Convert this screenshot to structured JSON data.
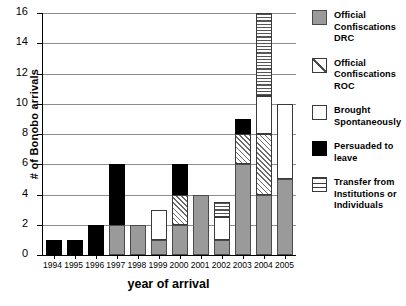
{
  "chart_data": {
    "type": "bar",
    "title": "",
    "subtitle": "",
    "xlabel": "year of arrival",
    "ylabel": "# of Bonobo arrivals",
    "ylim": [
      0,
      16
    ],
    "ytick_step": 2,
    "yticks": [
      "16",
      "14",
      "12",
      "10",
      "8",
      "6",
      "4",
      "2",
      "0"
    ],
    "grid": true,
    "grid_axis": "y",
    "stacked": true,
    "legend_position": "right",
    "categories": [
      "1994",
      "1995",
      "1996",
      "1997",
      "1998",
      "1999",
      "2000",
      "2001",
      "2002",
      "2003",
      "2004",
      "2005"
    ],
    "series": [
      {
        "name": "Official Confiscations DRC",
        "key": "drc",
        "pattern": "solid-gray",
        "color": "#9a9a9a",
        "values": [
          0,
          0,
          0,
          2,
          2,
          1,
          2,
          4,
          1,
          6,
          4,
          5
        ]
      },
      {
        "name": "Official Confiscations ROC",
        "key": "roc",
        "pattern": "diagonal-hatch",
        "color": "#ffffff",
        "values": [
          0,
          0,
          0,
          0,
          0,
          0,
          2,
          0,
          0,
          2,
          4,
          0
        ]
      },
      {
        "name": "Brought Spontaneously",
        "key": "white",
        "pattern": "solid-white",
        "color": "#ffffff",
        "values": [
          0,
          0,
          0,
          0,
          0,
          2,
          0,
          0,
          1.5,
          0,
          2.5,
          5
        ]
      },
      {
        "name": "Persuaded to leave",
        "key": "black",
        "pattern": "solid-black",
        "color": "#000000",
        "values": [
          1,
          1,
          2,
          4,
          0,
          0,
          2,
          0,
          0,
          1,
          0,
          0
        ]
      },
      {
        "name": "Transfer from Institutions or Individuals",
        "key": "lines",
        "pattern": "horizontal-lines",
        "color": "#ffffff",
        "values": [
          0,
          0,
          0,
          0,
          0,
          0,
          0,
          0,
          1,
          0,
          5.5,
          0
        ]
      }
    ],
    "totals": [
      1,
      1,
      2,
      6,
      2,
      3,
      6,
      4,
      3.5,
      9,
      16,
      10
    ]
  },
  "legend": {
    "items": [
      {
        "label": "Official Confiscations DRC",
        "swatch": "drc"
      },
      {
        "label": "Official Confiscations ROC",
        "swatch": "roc"
      },
      {
        "label": "Brought Spontaneously",
        "swatch": "white"
      },
      {
        "label": "Persuaded to leave",
        "swatch": "black"
      },
      {
        "label": "Transfer from Institutions or Individuals",
        "swatch": "lines"
      }
    ]
  }
}
